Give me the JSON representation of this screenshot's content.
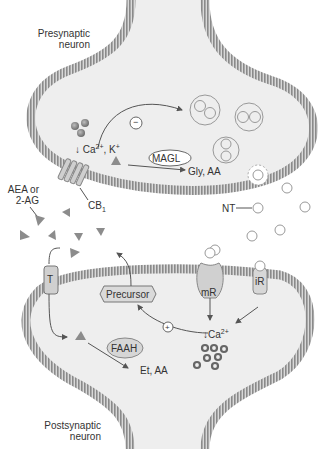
{
  "labels": {
    "presynaptic": [
      "Presynaptic",
      "neuron"
    ],
    "postsynaptic": [
      "Postsynaptic",
      "neuron"
    ],
    "ca_k": "Ca",
    "ca_k_sup": "2+",
    "ca_k_tail": ", K",
    "ca_k_tail_sup": "+",
    "ca_down_arrow": "↓",
    "inhibit": "−",
    "stimulate": "+",
    "magl": "MAGL",
    "magl_products": "Gly, AA",
    "aea_line1": "AEA or",
    "aea_line2": "2-AG",
    "cb1": "CB",
    "cb1_sub": "1",
    "nt": "NT",
    "transporter": "T",
    "precursor": "Precursor",
    "mr": "mR",
    "ir": "iR",
    "post_ca": "Ca",
    "post_ca_sup": "2+",
    "faah": "FAAH",
    "faah_products": "Et, AA"
  },
  "colors": {
    "cytoplasm": "#eeeeee",
    "membrane": "#8a8a8a",
    "membrane_light": "#d8d8d8",
    "ligand": "#8c8c8c",
    "calcium_ion": "#777777",
    "vesicle_stroke": "#999999",
    "text": "#333333"
  }
}
